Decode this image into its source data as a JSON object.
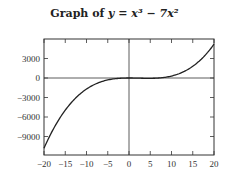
{
  "title": {
    "prefix": "Graph of ",
    "expr": "y = x³ − 7x²"
  },
  "chart_data": {
    "type": "line",
    "function": "x^3 - 7x^2",
    "xlabel": "",
    "ylabel": "",
    "xlim": [
      -20,
      20
    ],
    "ylim": [
      -12000,
      6000
    ],
    "x_ticks": [
      -20,
      -15,
      -10,
      -5,
      0,
      5,
      10,
      15,
      20
    ],
    "y_ticks": [
      3000,
      0,
      -3000,
      -6000,
      -9000
    ],
    "x_tick_labels": [
      "−20",
      "−15",
      "−10",
      "−5",
      "0",
      "5",
      "10",
      "15",
      "20"
    ],
    "y_tick_labels": [
      "3000",
      "0",
      "−3000",
      "−6000",
      "−9000"
    ],
    "series": [
      {
        "name": "y = x^3 - 7x^2",
        "x": [
          -20,
          -15,
          -10,
          -5,
          0,
          5,
          10,
          15,
          20
        ],
        "y": [
          -10800,
          -4950,
          -1700,
          -300,
          0,
          -50,
          300,
          1800,
          5200
        ]
      }
    ],
    "grid": false,
    "legend": "none"
  }
}
